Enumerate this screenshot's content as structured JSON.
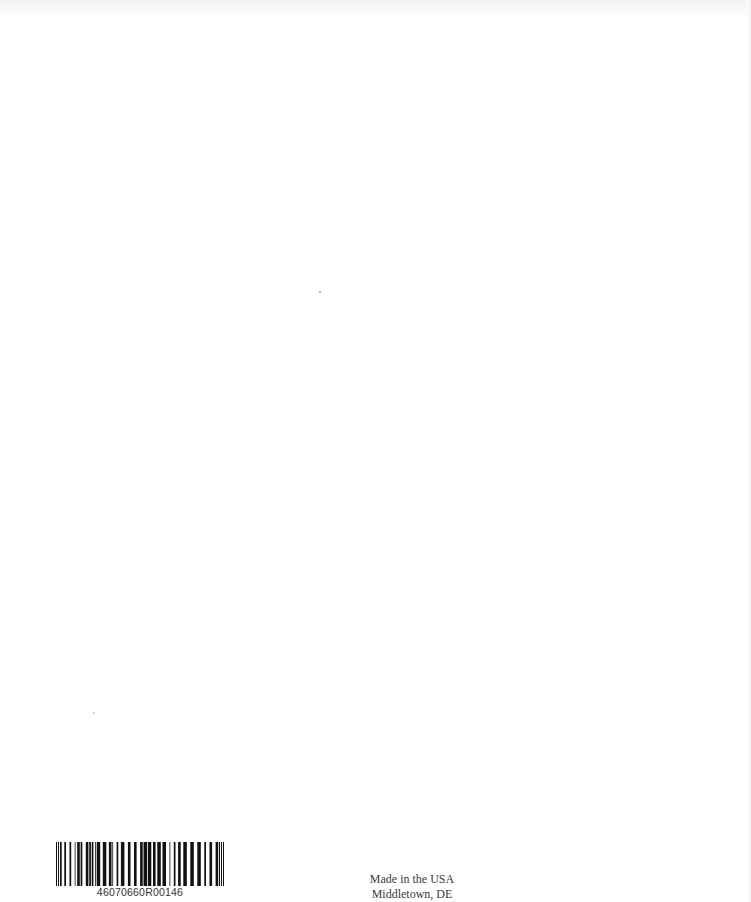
{
  "page": {
    "type": "book-back-cover-blank-page",
    "background_color": "#ffffff"
  },
  "barcode": {
    "icon": "barcode-icon",
    "number": "46070660R00146",
    "bar_color": "#111111"
  },
  "imprint": {
    "line1": "Made in the USA",
    "line2": "Middletown, DE"
  }
}
